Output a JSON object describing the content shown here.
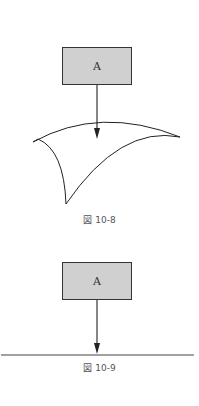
{
  "figures": [
    {
      "box_label": "A",
      "caption": "図 10-8",
      "surface": "curved-sheet"
    },
    {
      "box_label": "A",
      "caption": "図 10-9",
      "surface": "flat-line"
    }
  ],
  "colors": {
    "box_fill": "#d0d0d0",
    "stroke": "#222222",
    "caption_text": "#555555"
  }
}
